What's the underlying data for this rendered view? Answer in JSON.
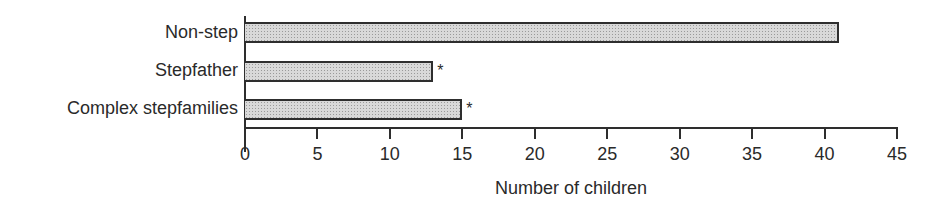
{
  "chart_data": {
    "type": "bar",
    "orientation": "horizontal",
    "title": "",
    "categories": [
      "Non-step",
      "Stepfather",
      "Complex stepfamilies"
    ],
    "values": [
      41,
      13,
      15
    ],
    "annotations": [
      "",
      "*",
      "*"
    ],
    "xlabel": "Number of children",
    "ylabel": "",
    "xlim": [
      0,
      45
    ],
    "xticks": [
      "0",
      "5",
      "10",
      "15",
      "20",
      "25",
      "30",
      "35",
      "40",
      "45"
    ],
    "grid": false,
    "legend": null,
    "bar_fill": "#d9d9d9",
    "bar_border": "#2e2e2e"
  }
}
